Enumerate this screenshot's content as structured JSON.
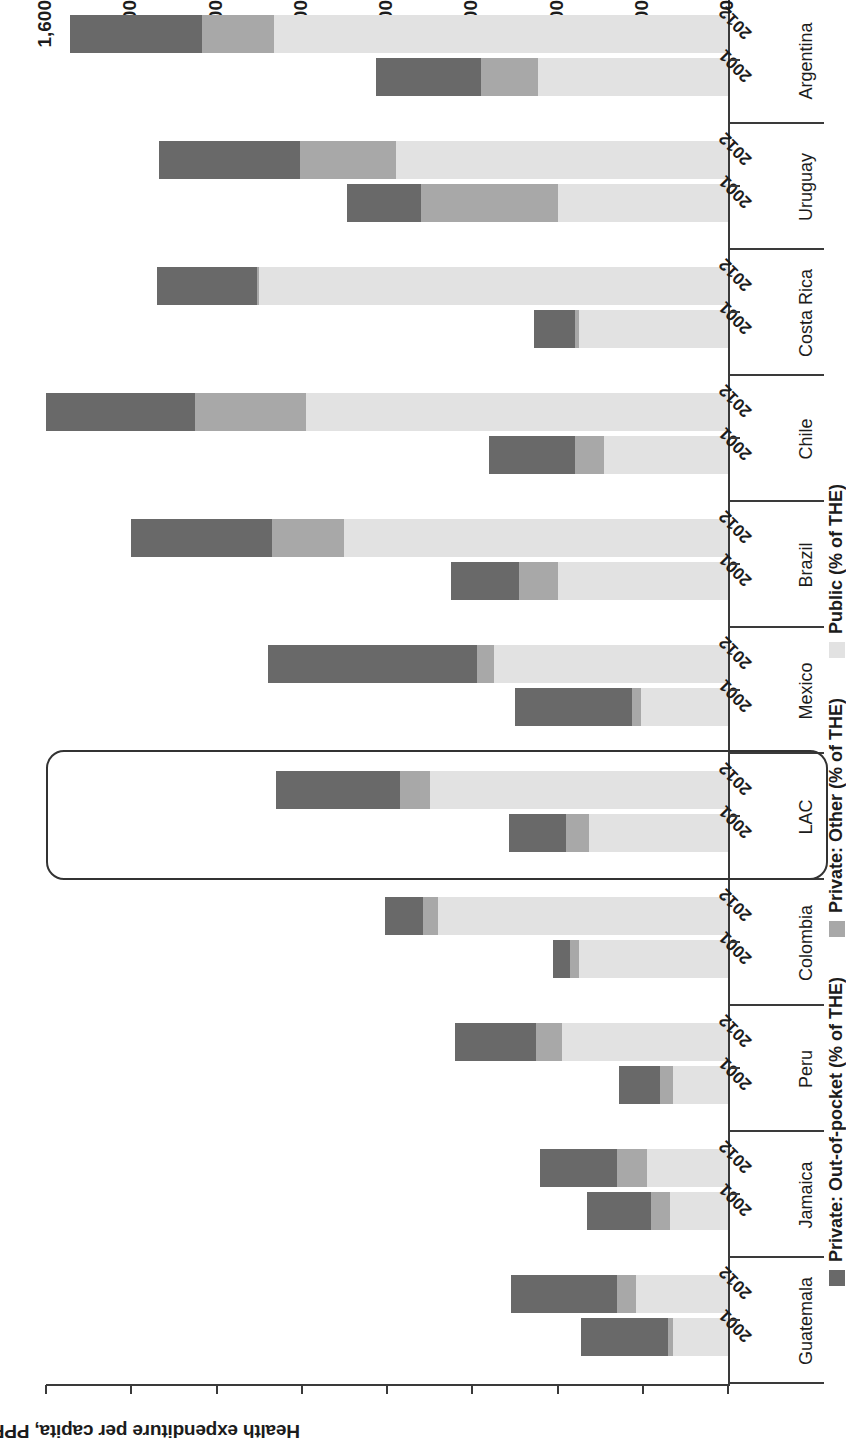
{
  "chart_data": {
    "type": "bar",
    "subtype": "stacked-horizontal-grouped",
    "title": "",
    "ylabel": "Health expenditure per capita, PPP",
    "xlabel": "",
    "ylim": [
      0,
      1600
    ],
    "yticks": [
      0,
      200,
      400,
      600,
      800,
      1000,
      1200,
      1400,
      1600
    ],
    "ytick_labels": [
      "0",
      "200",
      "400",
      "600",
      "800",
      "1,000",
      "1,200",
      "1,400",
      "1,600"
    ],
    "grid": false,
    "legend_position": "bottom",
    "orientation_note": "figure printed rotated 180 degrees on the page",
    "years": [
      "2001",
      "2012"
    ],
    "categories": [
      "Guatemala",
      "Jamaica",
      "Peru",
      "Colombia",
      "LAC",
      "Mexico",
      "Brazil",
      "Chile",
      "Costa Rica",
      "Uruguay",
      "Argentina"
    ],
    "highlighted_category": "LAC",
    "series": [
      {
        "name": "Private: Out-of-pocket (% of THE)",
        "color": "#696969",
        "values_2001": [
          205,
          150,
          95,
          40,
          135,
          275,
          160,
          200,
          95,
          175,
          247
        ],
        "values_2012": [
          250,
          180,
          190,
          90,
          290,
          490,
          330,
          350,
          235,
          330,
          311
        ]
      },
      {
        "name": "Private: Other (% of THE)",
        "color": "#a8a8a8",
        "values_2001": [
          10,
          45,
          30,
          20,
          55,
          20,
          90,
          70,
          10,
          320,
          134
        ],
        "values_2012": [
          45,
          70,
          60,
          35,
          70,
          40,
          170,
          260,
          5,
          225,
          169
        ]
      },
      {
        "name": "Public (% of THE)",
        "color": "#e2e2e2",
        "values_2001": [
          130,
          135,
          130,
          350,
          325,
          205,
          400,
          290,
          350,
          400,
          445
        ],
        "values_2012": [
          215,
          190,
          390,
          680,
          700,
          550,
          900,
          990,
          1100,
          780,
          1064
        ]
      }
    ],
    "totals_2001": [
      345,
      330,
      255,
      410,
      515,
      500,
      650,
      560,
      455,
      895,
      826
    ],
    "totals_2012": [
      510,
      440,
      640,
      805,
      1060,
      1080,
      1400,
      1600,
      1340,
      1335,
      1544
    ]
  },
  "axis": {
    "value_axis_title": "Health expenditure per capita, PPP"
  },
  "legend": {
    "items": [
      {
        "label": "Private: Out-of-pocket (% of THE)",
        "swatch": "oop"
      },
      {
        "label": "Private: Other (% of THE)",
        "swatch": "oth"
      },
      {
        "label": "Public (% of THE)",
        "swatch": "pub"
      }
    ]
  },
  "colors": {
    "out_of_pocket": "#696969",
    "other": "#a8a8a8",
    "public": "#e2e2e2",
    "axis": "#3a3a3a",
    "highlight_border": "#333333"
  }
}
